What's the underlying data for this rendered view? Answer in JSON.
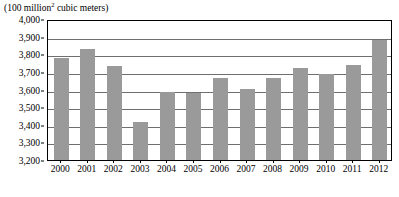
{
  "caption": {
    "prefix": "(100 million",
    "superscript": "2",
    "suffix": " cubic meters)"
  },
  "colors": {
    "bar_fill": "#9a9a9a",
    "gridline": "#6f6f6f",
    "frame": "#000000",
    "background": "#ffffff",
    "text": "#000000"
  },
  "chart_data": {
    "type": "bar",
    "title": "",
    "subtitle": "",
    "xlabel": "",
    "ylabel": "(100 million2 cubic meters)",
    "categories": [
      "2000",
      "2001",
      "2002",
      "2003",
      "2004",
      "2005",
      "2006",
      "2007",
      "2008",
      "2009",
      "2010",
      "2011",
      "2012"
    ],
    "values": [
      3780,
      3830,
      3735,
      3415,
      3585,
      3580,
      3665,
      3605,
      3665,
      3720,
      3690,
      3740,
      3880
    ],
    "series": [
      {
        "name": "water resources",
        "values": [
          3780,
          3830,
          3735,
          3415,
          3585,
          3580,
          3665,
          3605,
          3665,
          3720,
          3690,
          3740,
          3880
        ]
      }
    ],
    "ylim": [
      3200,
      4000
    ],
    "ytick_values": [
      4000,
      3900,
      3800,
      3700,
      3600,
      3500,
      3400,
      3300,
      3200
    ],
    "ytick_labels": [
      "4,000",
      "3,900",
      "3,800",
      "3,700",
      "3,600",
      "3,500",
      "3,400",
      "3,300",
      "3,200"
    ],
    "ytick_step": 100,
    "grid": true,
    "grid_axis": "y",
    "legend": false,
    "legend_position": "none",
    "annotations": []
  }
}
